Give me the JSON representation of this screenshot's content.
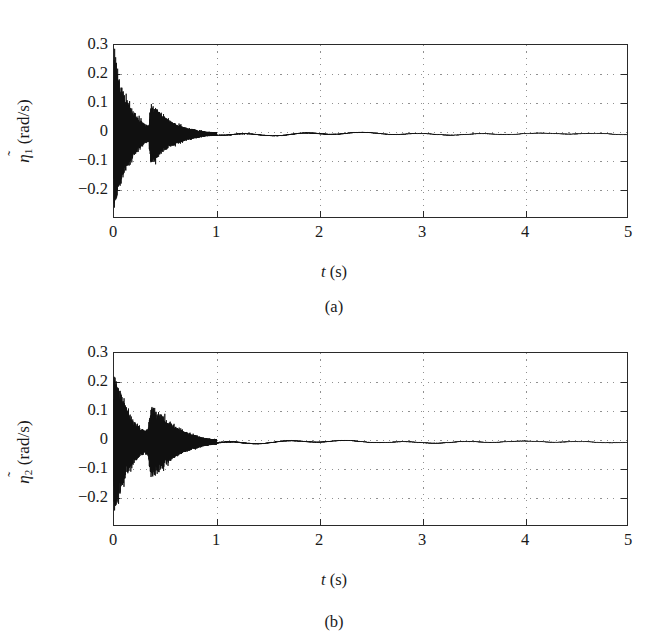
{
  "figure": {
    "panels": [
      {
        "id": "a",
        "caption": "(a)",
        "xlabel_var": "t",
        "xlabel_unit": "(s)",
        "ylabel_var": "η",
        "ylabel_tilde": "̃",
        "ylabel_sub": "1",
        "ylabel_unit": "(rad/s)",
        "yticks": [
          "0.3",
          "0.2",
          "0.1",
          "0",
          "−0.1",
          "−0.2"
        ],
        "xticks": [
          "0",
          "1",
          "2",
          "3",
          "4",
          "5"
        ]
      },
      {
        "id": "b",
        "caption": "(b)",
        "xlabel_var": "t",
        "xlabel_unit": "(s)",
        "ylabel_var": "η",
        "ylabel_tilde": "̃",
        "ylabel_sub": "2",
        "ylabel_unit": "(rad/s)",
        "yticks": [
          "0.3",
          "0.2",
          "0.1",
          "0",
          "−0.1",
          "−0.2"
        ],
        "xticks": [
          "0",
          "1",
          "2",
          "3",
          "4",
          "5"
        ]
      }
    ]
  },
  "chart_data": [
    {
      "type": "line",
      "id": "a",
      "title": "",
      "xlabel": "t (s)",
      "ylabel": "η̃1 (rad/s)",
      "xlim": [
        0,
        5
      ],
      "ylim": [
        -0.28,
        0.3
      ],
      "xticks": [
        0,
        1,
        2,
        3,
        4,
        5
      ],
      "yticks": [
        -0.2,
        -0.1,
        0,
        0.1,
        0.2,
        0.3
      ],
      "grid": true,
      "legend": null,
      "series": [
        {
          "name": "eta_tilde_1",
          "description": "High-frequency chattering estimation error. Initial burst at t=0 with envelope ±0.25 decaying exponentially; secondary burst near t=0.35-0.45 reaching +0.11/-0.10; decays to near zero by t≈0.9; small residual ripple ±0.01 thereafter.",
          "envelope_points": [
            {
              "t": 0.0,
              "amp": 0.255
            },
            {
              "t": 0.03,
              "amp": 0.215
            },
            {
              "t": 0.06,
              "amp": 0.175
            },
            {
              "t": 0.1,
              "amp": 0.135
            },
            {
              "t": 0.15,
              "amp": 0.1
            },
            {
              "t": 0.2,
              "amp": 0.072
            },
            {
              "t": 0.25,
              "amp": 0.05
            },
            {
              "t": 0.3,
              "amp": 0.034
            },
            {
              "t": 0.34,
              "amp": 0.028
            },
            {
              "t": 0.36,
              "amp": 0.105
            },
            {
              "t": 0.39,
              "amp": 0.095
            },
            {
              "t": 0.43,
              "amp": 0.08
            },
            {
              "t": 0.48,
              "amp": 0.06
            },
            {
              "t": 0.55,
              "amp": 0.044
            },
            {
              "t": 0.62,
              "amp": 0.032
            },
            {
              "t": 0.7,
              "amp": 0.022
            },
            {
              "t": 0.8,
              "amp": 0.014
            },
            {
              "t": 0.9,
              "amp": 0.008
            },
            {
              "t": 1.0,
              "amp": 0.006
            },
            {
              "t": 1.2,
              "amp": 0.009
            },
            {
              "t": 1.5,
              "amp": 0.006
            },
            {
              "t": 2.0,
              "amp": 0.007
            },
            {
              "t": 2.5,
              "amp": 0.005
            },
            {
              "t": 3.0,
              "amp": 0.004
            },
            {
              "t": 4.0,
              "amp": 0.003
            },
            {
              "t": 5.0,
              "amp": 0.003
            }
          ]
        }
      ]
    },
    {
      "type": "line",
      "id": "b",
      "title": "",
      "xlabel": "t (s)",
      "ylabel": "η̃2 (rad/s)",
      "xlim": [
        0,
        5
      ],
      "ylim": [
        -0.28,
        0.3
      ],
      "xticks": [
        0,
        1,
        2,
        3,
        4,
        5
      ],
      "yticks": [
        -0.2,
        -0.1,
        0,
        0.1,
        0.2,
        0.3
      ],
      "grid": true,
      "legend": null,
      "series": [
        {
          "name": "eta_tilde_2",
          "description": "High-frequency chattering estimation error. Initial burst at t=0 with envelope ±0.24 decaying exponentially; secondary burst near t=0.33-0.50 reaching +0.12/-0.12; decays to near zero by t≈0.95; small residual ripple ±0.01 thereafter.",
          "envelope_points": [
            {
              "t": 0.0,
              "amp": 0.245
            },
            {
              "t": 0.03,
              "amp": 0.21
            },
            {
              "t": 0.06,
              "amp": 0.172
            },
            {
              "t": 0.1,
              "amp": 0.132
            },
            {
              "t": 0.15,
              "amp": 0.098
            },
            {
              "t": 0.2,
              "amp": 0.07
            },
            {
              "t": 0.25,
              "amp": 0.05
            },
            {
              "t": 0.3,
              "amp": 0.038
            },
            {
              "t": 0.33,
              "amp": 0.045
            },
            {
              "t": 0.36,
              "amp": 0.12
            },
            {
              "t": 0.4,
              "amp": 0.115
            },
            {
              "t": 0.45,
              "amp": 0.098
            },
            {
              "t": 0.52,
              "amp": 0.072
            },
            {
              "t": 0.6,
              "amp": 0.052
            },
            {
              "t": 0.68,
              "amp": 0.036
            },
            {
              "t": 0.78,
              "amp": 0.024
            },
            {
              "t": 0.88,
              "amp": 0.014
            },
            {
              "t": 0.98,
              "amp": 0.009
            },
            {
              "t": 1.1,
              "amp": 0.011
            },
            {
              "t": 1.3,
              "amp": 0.007
            },
            {
              "t": 1.6,
              "amp": 0.006
            },
            {
              "t": 2.0,
              "amp": 0.006
            },
            {
              "t": 2.6,
              "amp": 0.004
            },
            {
              "t": 3.2,
              "amp": 0.004
            },
            {
              "t": 4.0,
              "amp": 0.003
            },
            {
              "t": 5.0,
              "amp": 0.003
            }
          ]
        }
      ]
    }
  ]
}
